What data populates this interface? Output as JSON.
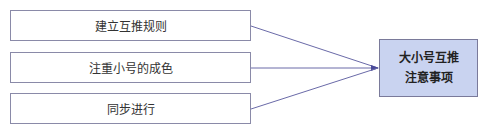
{
  "diagram": {
    "inputs": [
      {
        "label": "建立互推规则"
      },
      {
        "label": "注重小号的成色"
      },
      {
        "label": "同步进行"
      }
    ],
    "target": {
      "line1": "大小号互推",
      "line2": "注意事项"
    },
    "colors": {
      "box_border": "#8a8aa8",
      "target_fill": "#c9d3f0",
      "connector": "#5a5aa0"
    }
  }
}
